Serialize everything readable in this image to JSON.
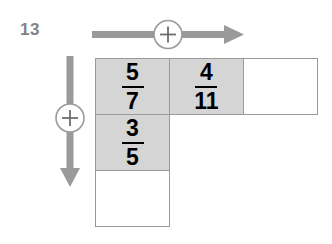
{
  "worksheet": {
    "problem_number": "13",
    "colors": {
      "shaded_cell": "#d5d5d5",
      "cell_border": "#9a9a9a",
      "arrow": "#9a9a9a",
      "problem_number": "#808285",
      "fraction_text": "#000000",
      "background": "#ffffff"
    }
  },
  "operators": {
    "horizontal": {
      "symbol": "+",
      "name": "plus-circle-horizontal",
      "direction": "right"
    },
    "vertical": {
      "symbol": "+",
      "name": "plus-circle-vertical",
      "direction": "down"
    }
  },
  "grid": {
    "rows": 3,
    "columns": 3,
    "cells": [
      {
        "row": 1,
        "col": 1,
        "state": "shaded",
        "fraction": {
          "numerator": "5",
          "denominator": "7"
        }
      },
      {
        "row": 1,
        "col": 2,
        "state": "shaded",
        "fraction": {
          "numerator": "4",
          "denominator": "11"
        }
      },
      {
        "row": 1,
        "col": 3,
        "state": "empty",
        "fraction": {
          "numerator": "",
          "denominator": ""
        }
      },
      {
        "row": 2,
        "col": 1,
        "state": "shaded",
        "fraction": {
          "numerator": "3",
          "denominator": "5"
        }
      },
      {
        "row": 3,
        "col": 1,
        "state": "empty",
        "fraction": {
          "numerator": "",
          "denominator": ""
        }
      }
    ]
  }
}
